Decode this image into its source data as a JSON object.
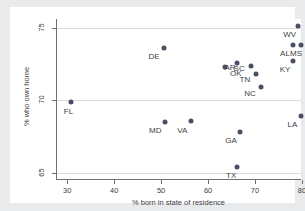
{
  "chart_data": {
    "type": "scatter",
    "title": "",
    "xlabel": "% born in state of residence",
    "ylabel": "% who own home",
    "xlim": [
      27.6,
      79.8
    ],
    "ylim": [
      64.6,
      75.6
    ],
    "xticks": [
      30,
      40,
      50,
      60,
      70,
      80
    ],
    "yticks": [
      65,
      70,
      75
    ],
    "grid": "horizontal-faint",
    "legend": "none",
    "marker_color": "#4a4f63",
    "points": [
      {
        "label": "FL",
        "x": 30.9,
        "y": 69.9,
        "label_dx": -3,
        "label_dy": 5
      },
      {
        "label": "DE",
        "x": 50.6,
        "y": 73.6,
        "label_dx": -10,
        "label_dy": 4
      },
      {
        "label": "MD",
        "x": 50.9,
        "y": 68.5,
        "label_dx": -10,
        "label_dy": 4
      },
      {
        "label": "VA",
        "x": 56.4,
        "y": 68.6,
        "label_dx": -9,
        "label_dy": 5
      },
      {
        "label": "AR",
        "x": 63.6,
        "y": 72.3,
        "label_dx": 5,
        "label_dy": -4
      },
      {
        "label": "SC",
        "x": 66.2,
        "y": 72.6,
        "label_dx": 2,
        "label_dy": 1
      },
      {
        "label": "GA",
        "x": 66.8,
        "y": 67.8,
        "label_dx": -9,
        "label_dy": 4
      },
      {
        "label": "TX",
        "x": 66.2,
        "y": 65.4,
        "label_dx": -6,
        "label_dy": 4
      },
      {
        "label": "OK",
        "x": 69.1,
        "y": 72.4,
        "label_dx": -15,
        "label_dy": 3
      },
      {
        "label": "TN",
        "x": 70.2,
        "y": 71.8,
        "label_dx": -11,
        "label_dy": 1
      },
      {
        "label": "NC",
        "x": 71.3,
        "y": 70.9,
        "label_dx": -11,
        "label_dy": 2
      },
      {
        "label": "AL",
        "x": 78.1,
        "y": 73.8,
        "label_dx": -8,
        "label_dy": 4
      },
      {
        "label": "MS",
        "x": 79.8,
        "y": 73.8,
        "label_dx": -5,
        "label_dy": 4
      },
      {
        "label": "KY",
        "x": 78.1,
        "y": 72.7,
        "label_dx": -8,
        "label_dy": 4
      },
      {
        "label": "WV",
        "x": 79.1,
        "y": 75.1,
        "label_dx": -8,
        "label_dy": 4
      },
      {
        "label": "LA",
        "x": 79.9,
        "y": 68.9,
        "label_dx": -9,
        "label_dy": 4
      }
    ]
  }
}
